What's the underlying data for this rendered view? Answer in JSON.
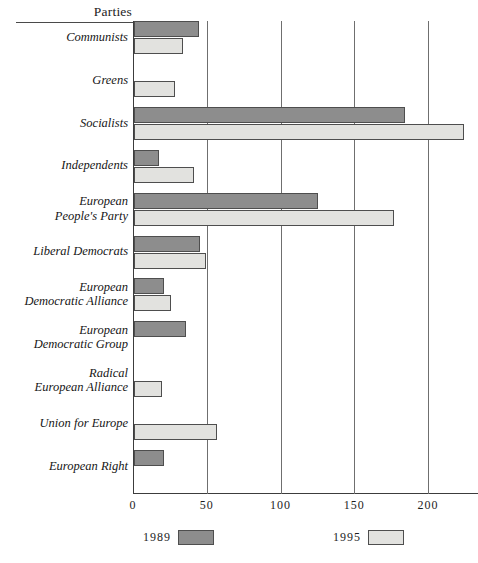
{
  "header": {
    "title": "Parties"
  },
  "legend": [
    {
      "label": "1989",
      "swatch": "dark",
      "color": "#8d8d8d"
    },
    {
      "label": "1995",
      "swatch": "light",
      "color": "#e2e2df"
    }
  ],
  "axis": {
    "ticks": [
      "0",
      "50",
      "100",
      "150",
      "200"
    ]
  },
  "chart_data": {
    "type": "bar",
    "orientation": "horizontal",
    "title": "",
    "subtitle": "",
    "xlabel": "",
    "ylabel": "Parties",
    "xlim": [
      0,
      200
    ],
    "xticks": [
      0,
      50,
      100,
      150,
      200
    ],
    "xtick_labels": [
      "0",
      "50",
      "100",
      "150",
      "200"
    ],
    "grid": "vertical",
    "legend_position": "bottom",
    "categories": [
      "Communists",
      "Greens",
      "Socialists",
      "Independents",
      "European People's Party",
      "Liberal Democrats",
      "European Democratic Alliance",
      "European Democratic Group",
      "Radical European Alliance",
      "Union for Europe",
      "European Right"
    ],
    "category_lines": [
      [
        "Communists"
      ],
      [
        "Greens"
      ],
      [
        "Socialists"
      ],
      [
        "Independents"
      ],
      [
        "European",
        "People's Party"
      ],
      [
        "Liberal Democrats"
      ],
      [
        "European",
        "Democratic Alliance"
      ],
      [
        "European",
        "Democratic Group"
      ],
      [
        "Radical",
        "European Alliance"
      ],
      [
        "Union for Europe"
      ],
      [
        "European Right"
      ]
    ],
    "series": [
      {
        "name": "1989",
        "color": "#8d8d8d",
        "values": [
          44,
          null,
          184,
          17,
          125,
          45,
          20,
          35,
          null,
          null,
          20
        ]
      },
      {
        "name": "1995",
        "color": "#e2e2df",
        "values": [
          33,
          28,
          224,
          41,
          176,
          49,
          25,
          null,
          19,
          56,
          null
        ]
      }
    ]
  }
}
